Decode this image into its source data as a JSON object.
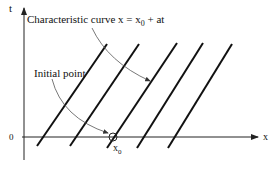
{
  "diagram": {
    "axes": {
      "x_label": "x",
      "y_label": "t",
      "origin_label": "0"
    },
    "annotations": {
      "characteristic_curve": "Characteristic curve x = x",
      "characteristic_sub": "0",
      "characteristic_tail": " + at",
      "initial_point": "Initial point",
      "x0_main": "x",
      "x0_sub": "0"
    },
    "characteristic_line_count": 5,
    "colors": {
      "line": "#111111",
      "axis": "#222222",
      "annotation": "#555555"
    }
  }
}
